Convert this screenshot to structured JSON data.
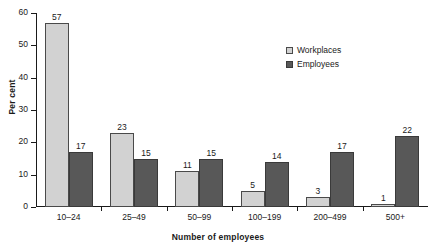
{
  "chart_data": {
    "type": "bar",
    "title": "",
    "xlabel": "Number of employees",
    "ylabel": "Per cent",
    "categories": [
      "10–24",
      "25–49",
      "50–99",
      "100–199",
      "200–499",
      "500+"
    ],
    "series": [
      {
        "name": "Workplaces",
        "color": "#d2d2d2",
        "values": [
          57,
          23,
          11,
          5,
          3,
          1
        ]
      },
      {
        "name": "Employees",
        "color": "#585858",
        "values": [
          17,
          15,
          15,
          14,
          17,
          22
        ]
      }
    ],
    "ylim": [
      0,
      60
    ],
    "yticks": [
      0,
      10,
      20,
      30,
      40,
      50,
      60
    ],
    "ytick_labels": [
      "0",
      "10",
      "20",
      "30",
      "40",
      "50",
      "60"
    ],
    "grid": false,
    "legend_position": "upper right",
    "value_labels": true
  },
  "axes": {
    "y_title": "Per cent",
    "x_title": "Number of employees"
  },
  "legend": {
    "items": [
      {
        "label": "Workplaces"
      },
      {
        "label": "Employees"
      }
    ]
  }
}
